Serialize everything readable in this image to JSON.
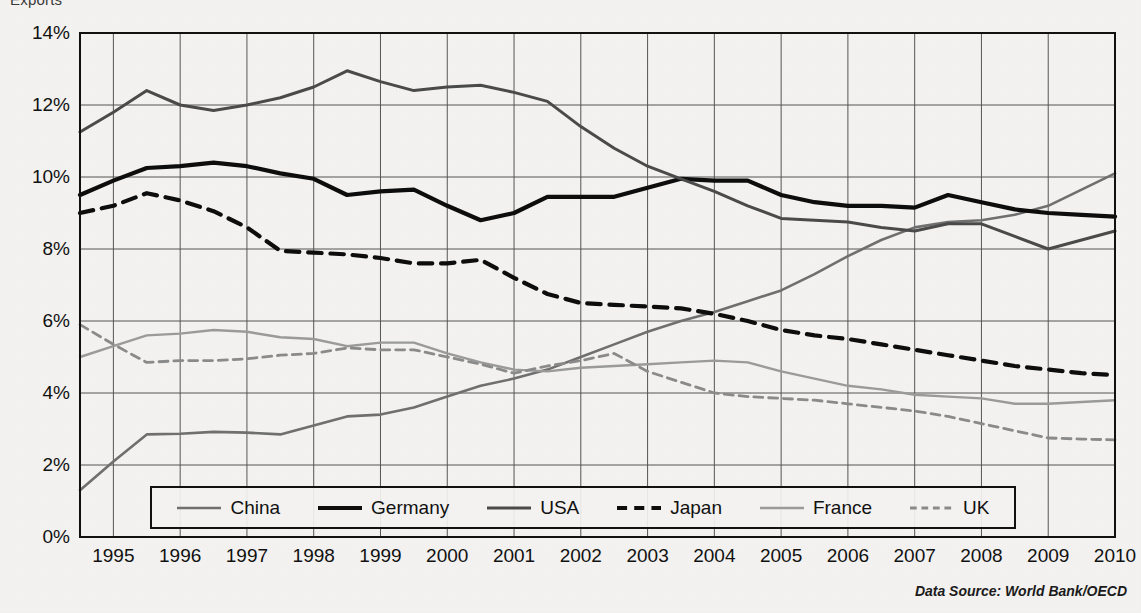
{
  "title_clipped": "Exports",
  "data_source": "Data Source: World Bank/OECD",
  "legend": {
    "items": [
      {
        "label": "China",
        "color": "#6f6f6f",
        "style": "solid",
        "width": 2.6
      },
      {
        "label": "Germany",
        "color": "#0d0d0d",
        "style": "solid",
        "width": 4.2
      },
      {
        "label": "USA",
        "color": "#4a4a4a",
        "style": "solid",
        "width": 3.0
      },
      {
        "label": "Japan",
        "color": "#0d0d0d",
        "style": "dashed",
        "width": 4.2
      },
      {
        "label": "France",
        "color": "#9a9a9a",
        "style": "solid",
        "width": 2.4
      },
      {
        "label": "UK",
        "color": "#8a8a8a",
        "style": "dashed",
        "width": 2.8
      }
    ]
  },
  "axes": {
    "y_ticks": [
      "0%",
      "2%",
      "4%",
      "6%",
      "8%",
      "10%",
      "12%",
      "14%"
    ],
    "x_ticks": [
      "1995",
      "1996",
      "1997",
      "1998",
      "1999",
      "2000",
      "2001",
      "2002",
      "2003",
      "2004",
      "2005",
      "2006",
      "2007",
      "2008",
      "2009",
      "2010"
    ]
  },
  "chart_data": {
    "type": "line",
    "title": "Exports",
    "xlabel": "",
    "ylabel": "",
    "ylim": [
      0,
      14
    ],
    "xlim": [
      1994.5,
      2010.0
    ],
    "grid": true,
    "legend_position": "bottom-inside",
    "y_tick_values": [
      0,
      2,
      4,
      6,
      8,
      10,
      12,
      14
    ],
    "y_tick_labels": [
      "0%",
      "2%",
      "4%",
      "6%",
      "8%",
      "10%",
      "12%",
      "14%"
    ],
    "x_tick_values": [
      1995,
      1996,
      1997,
      1998,
      1999,
      2000,
      2001,
      2002,
      2003,
      2004,
      2005,
      2006,
      2007,
      2008,
      2009,
      2010
    ],
    "x": [
      1994.5,
      1995.0,
      1995.5,
      1996.0,
      1996.5,
      1997.0,
      1997.5,
      1998.0,
      1998.5,
      1999.0,
      1999.5,
      2000.0,
      2000.5,
      2001.0,
      2001.5,
      2002.0,
      2002.5,
      2003.0,
      2003.5,
      2004.0,
      2004.5,
      2005.0,
      2005.5,
      2006.0,
      2006.5,
      2007.0,
      2007.5,
      2008.0,
      2008.5,
      2009.0,
      2009.5,
      2010.0
    ],
    "series": [
      {
        "name": "China",
        "color": "#6f6f6f",
        "style": "solid",
        "values": [
          1.3,
          2.1,
          2.85,
          2.87,
          2.92,
          2.9,
          2.85,
          3.1,
          3.35,
          3.4,
          3.6,
          3.9,
          4.2,
          4.4,
          4.65,
          5.0,
          5.35,
          5.7,
          6.0,
          6.25,
          6.55,
          6.85,
          7.3,
          7.8,
          8.25,
          8.6,
          8.75,
          8.8,
          8.95,
          9.2,
          9.65,
          10.1
        ]
      },
      {
        "name": "Germany",
        "color": "#0d0d0d",
        "style": "solid",
        "values": [
          9.5,
          9.9,
          10.25,
          10.3,
          10.4,
          10.3,
          10.1,
          9.95,
          9.5,
          9.6,
          9.65,
          9.2,
          8.8,
          9.0,
          9.45,
          9.45,
          9.45,
          9.7,
          9.95,
          9.9,
          9.9,
          9.5,
          9.3,
          9.2,
          9.2,
          9.15,
          9.5,
          9.3,
          9.1,
          9.0,
          8.95,
          8.9
        ]
      },
      {
        "name": "USA",
        "color": "#4a4a4a",
        "style": "solid",
        "values": [
          11.25,
          11.8,
          12.4,
          12.0,
          11.85,
          12.0,
          12.2,
          12.5,
          12.95,
          12.65,
          12.4,
          12.5,
          12.55,
          12.35,
          12.1,
          11.4,
          10.8,
          10.3,
          9.95,
          9.6,
          9.2,
          8.85,
          8.8,
          8.75,
          8.6,
          8.5,
          8.7,
          8.7,
          8.35,
          8.0,
          8.25,
          8.5
        ]
      },
      {
        "name": "Japan",
        "color": "#0d0d0d",
        "style": "dashed",
        "values": [
          9.0,
          9.2,
          9.55,
          9.35,
          9.05,
          8.6,
          7.95,
          7.9,
          7.85,
          7.75,
          7.6,
          7.6,
          7.7,
          7.2,
          6.75,
          6.5,
          6.45,
          6.4,
          6.35,
          6.2,
          6.0,
          5.75,
          5.6,
          5.5,
          5.35,
          5.2,
          5.05,
          4.9,
          4.75,
          4.65,
          4.55,
          4.5
        ]
      },
      {
        "name": "France",
        "color": "#9a9a9a",
        "style": "solid",
        "values": [
          5.0,
          5.3,
          5.6,
          5.65,
          5.75,
          5.7,
          5.55,
          5.5,
          5.3,
          5.4,
          5.4,
          5.1,
          4.85,
          4.65,
          4.6,
          4.7,
          4.75,
          4.8,
          4.85,
          4.9,
          4.85,
          4.6,
          4.4,
          4.2,
          4.1,
          3.95,
          3.9,
          3.85,
          3.7,
          3.7,
          3.75,
          3.8
        ]
      },
      {
        "name": "UK",
        "color": "#8a8a8a",
        "style": "dashed",
        "values": [
          5.9,
          5.35,
          4.85,
          4.9,
          4.9,
          4.95,
          5.05,
          5.1,
          5.25,
          5.2,
          5.2,
          5.0,
          4.8,
          4.55,
          4.75,
          4.9,
          5.1,
          4.6,
          4.3,
          4.0,
          3.9,
          3.85,
          3.8,
          3.7,
          3.6,
          3.5,
          3.35,
          3.15,
          2.95,
          2.75,
          2.72,
          2.7
        ]
      }
    ]
  }
}
